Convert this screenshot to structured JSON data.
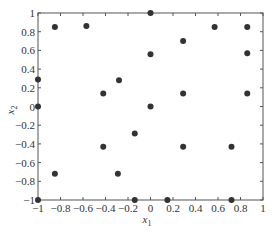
{
  "chart_data": {
    "type": "scatter",
    "title": "",
    "xlabel": "x1",
    "ylabel": "x2",
    "xlabel_main": "x",
    "xlabel_sub": "1",
    "ylabel_main": "x",
    "ylabel_sub": "2",
    "xlim": [
      -1,
      1
    ],
    "ylim": [
      -1,
      1
    ],
    "grid": false,
    "legend": null,
    "x_ticks": [
      -1,
      -0.8,
      -0.6,
      -0.4,
      -0.2,
      0,
      0.2,
      0.4,
      0.6,
      0.8,
      1
    ],
    "x_tick_labels": [
      "−1",
      "−0.8",
      "−0.6",
      "−0.4",
      "−0.2",
      "0",
      "0.2",
      "0.4",
      "0.6",
      "0.8",
      "1"
    ],
    "y_ticks": [
      1,
      0.8,
      0.6,
      0.4,
      0.2,
      0,
      -0.2,
      -0.4,
      -0.6,
      -0.8,
      -1
    ],
    "y_tick_labels": [
      "1",
      "0.8",
      "0.6",
      "0.4",
      "0.2",
      "0",
      "−0.2",
      "−0.4",
      "−0.6",
      "−0.8",
      "−1"
    ],
    "marker_color": "#333333",
    "axis_color": "#555555",
    "series": [
      {
        "name": "points",
        "points": [
          {
            "x": -0.85,
            "y": 0.85
          },
          {
            "x": -0.57,
            "y": 0.86
          },
          {
            "x": 0.0,
            "y": 1.0
          },
          {
            "x": 0.57,
            "y": 0.85
          },
          {
            "x": 0.86,
            "y": 0.85
          },
          {
            "x": 0.29,
            "y": 0.7
          },
          {
            "x": 0.0,
            "y": 0.56
          },
          {
            "x": 0.86,
            "y": 0.57
          },
          {
            "x": -1.0,
            "y": 0.29
          },
          {
            "x": -0.28,
            "y": 0.28
          },
          {
            "x": -0.42,
            "y": 0.14
          },
          {
            "x": 0.29,
            "y": 0.14
          },
          {
            "x": 0.86,
            "y": 0.14
          },
          {
            "x": -1.0,
            "y": 0.0
          },
          {
            "x": 0.0,
            "y": 0.0
          },
          {
            "x": -0.14,
            "y": -0.29
          },
          {
            "x": -0.42,
            "y": -0.43
          },
          {
            "x": 0.29,
            "y": -0.43
          },
          {
            "x": 0.72,
            "y": -0.43
          },
          {
            "x": -0.85,
            "y": -0.72
          },
          {
            "x": -0.29,
            "y": -0.72
          },
          {
            "x": -1.0,
            "y": -1.0
          },
          {
            "x": -0.14,
            "y": -1.0
          },
          {
            "x": 0.15,
            "y": -1.0
          },
          {
            "x": 0.72,
            "y": -1.0
          }
        ]
      }
    ]
  }
}
